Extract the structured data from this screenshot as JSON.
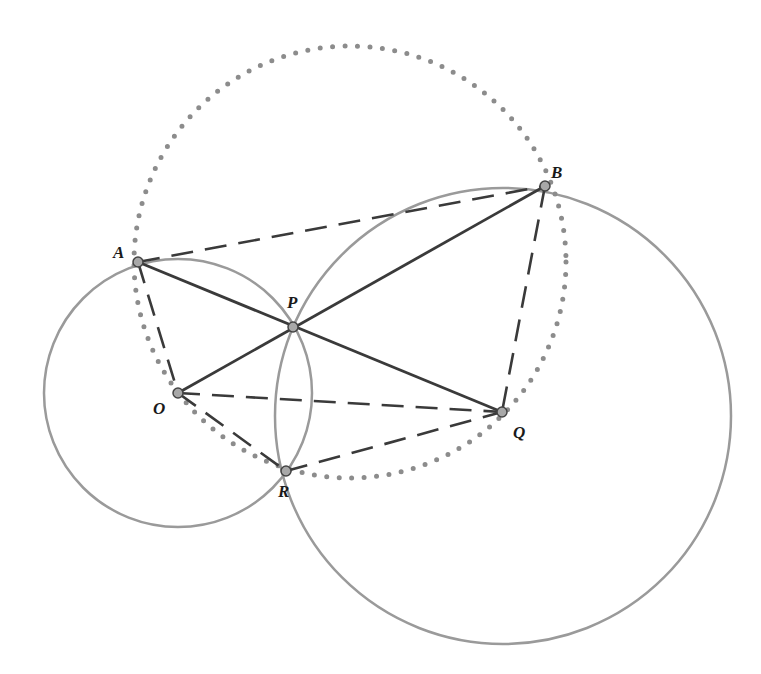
{
  "diagram": {
    "colors": {
      "circle": "#9a9a9a",
      "dotted": "#8c8c8c",
      "solid_line": "#3a3a3a",
      "dashed_line": "#3a3a3a",
      "point_fill": "#a8a8a8",
      "point_stroke": "#444444",
      "label": "#1a1a1a"
    },
    "points": {
      "A": {
        "label": "A",
        "x": 138,
        "y": 262,
        "lx": 113,
        "ly": 258
      },
      "B": {
        "label": "B",
        "x": 545,
        "y": 186,
        "lx": 551,
        "ly": 178
      },
      "P": {
        "label": "P",
        "x": 293,
        "y": 327,
        "lx": 287,
        "ly": 308
      },
      "O": {
        "label": "O",
        "x": 178,
        "y": 393,
        "lx": 153,
        "ly": 414
      },
      "Q": {
        "label": "Q",
        "x": 502,
        "y": 412,
        "lx": 513,
        "ly": 438
      },
      "R": {
        "label": "R",
        "x": 286,
        "y": 471,
        "lx": 278,
        "ly": 497
      }
    },
    "circles": [
      {
        "name": "small-circle",
        "cx": 178,
        "cy": 393,
        "r": 134,
        "style": "solid"
      },
      {
        "name": "large-circle",
        "cx": 503,
        "cy": 416,
        "r": 228,
        "style": "solid"
      },
      {
        "name": "dotted-circle",
        "cx": 350,
        "cy": 262,
        "r": 216,
        "style": "dotted"
      }
    ],
    "solid_segments": [
      [
        "A",
        "Q"
      ],
      [
        "O",
        "B"
      ]
    ],
    "dashed_segments": [
      [
        "A",
        "B"
      ],
      [
        "A",
        "O"
      ],
      [
        "O",
        "Q"
      ],
      [
        "B",
        "Q"
      ],
      [
        "O",
        "R"
      ],
      [
        "R",
        "Q"
      ]
    ]
  }
}
